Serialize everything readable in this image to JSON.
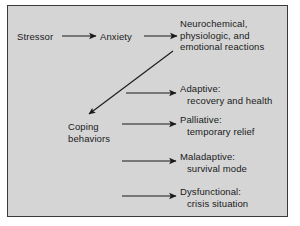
{
  "figure": {
    "background_color": "#ffffff",
    "panel_color": "#d5d5d5",
    "border_color": "#3a3a3a",
    "ink_color": "#1a1a1a"
  },
  "nodes": {
    "stressor": {
      "line1": "Stressor"
    },
    "anxiety": {
      "line1": "Anxiety"
    },
    "reactions": {
      "line1": "Neurochemical,",
      "line2": "physiologic, and",
      "line3": "emotional reactions"
    },
    "coping": {
      "line1": "Coping",
      "line2": "behaviors"
    },
    "adaptive": {
      "line1": "Adaptive:",
      "line2": "recovery and health"
    },
    "palliative": {
      "line1": "Palliative:",
      "line2": "temporary relief"
    },
    "maladaptive": {
      "line1": "Maladaptive:",
      "line2": "survival mode"
    },
    "dysfunctional": {
      "line1": "Dysfunctional:",
      "line2": "crisis situation"
    }
  },
  "arrows": [
    {
      "name": "stressor-to-anxiety",
      "from": "Stressor",
      "to": "Anxiety",
      "direction": "right"
    },
    {
      "name": "anxiety-to-reactions",
      "from": "Anxiety",
      "to": "Neurochemical, physiologic, and emotional reactions",
      "direction": "right"
    },
    {
      "name": "reactions-to-coping",
      "from": "Neurochemical, physiologic, and emotional reactions",
      "to": "Coping behaviors",
      "direction": "down-left"
    },
    {
      "name": "coping-to-adaptive",
      "from": "Coping behaviors",
      "to": "Adaptive: recovery and health",
      "direction": "right"
    },
    {
      "name": "coping-to-palliative",
      "from": "Coping behaviors",
      "to": "Palliative: temporary relief",
      "direction": "right"
    },
    {
      "name": "coping-to-maladaptive",
      "from": "Coping behaviors",
      "to": "Maladaptive: survival mode",
      "direction": "right"
    },
    {
      "name": "coping-to-dysfunctional",
      "from": "Coping behaviors",
      "to": "Dysfunctional: crisis situation",
      "direction": "right"
    }
  ]
}
